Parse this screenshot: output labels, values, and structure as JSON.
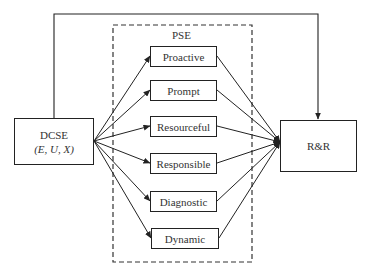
{
  "diagram": {
    "source": {
      "title": "DCSE",
      "subtitle": "(E, U, X)"
    },
    "group": {
      "label": "PSE",
      "style": "dashed"
    },
    "items": [
      {
        "label": "Proactive"
      },
      {
        "label": "Prompt"
      },
      {
        "label": "Resourceful"
      },
      {
        "label": "Responsible"
      },
      {
        "label": "Diagnostic"
      },
      {
        "label": "Dynamic"
      }
    ],
    "target": {
      "title": "R&R"
    },
    "edges": [
      "DCSE -> Proactive",
      "DCSE -> Prompt",
      "DCSE -> Resourceful",
      "DCSE -> Responsible",
      "DCSE -> Diagnostic",
      "DCSE -> Dynamic",
      "Proactive -> R&R",
      "Prompt -> R&R",
      "Resourceful -> R&R",
      "Responsible -> R&R",
      "Diagnostic -> R&R",
      "Dynamic -> R&R",
      "DCSE -> R&R (direct, over top)"
    ],
    "colors": {
      "line": "#222222",
      "text": "#333333",
      "background": "#ffffff"
    }
  }
}
